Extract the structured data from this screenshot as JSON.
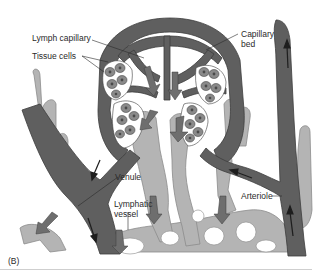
{
  "figure": {
    "panel_letter": "(B)",
    "labels": {
      "lymph_capillary": "Lymph capillary",
      "tissue_cells": "Tissue cells",
      "capillary_bed": "Capillary bed",
      "capillary_bed_line1": "Capillary",
      "capillary_bed_line2": "bed",
      "venule": "Venule",
      "lymphatic_vessel_line1": "Lymphatic",
      "lymphatic_vessel_line2": "vessel",
      "arteriole": "Arteriole"
    },
    "colors": {
      "blood_vessel": "#5f5f5f",
      "lymph_vessel": "#b4b4b4",
      "tissue_cell": "#8a8a8a",
      "cell_nucleus": "#4a4a4a",
      "flow_arrow": "#6e6e6e",
      "background": "#ffffff"
    }
  }
}
